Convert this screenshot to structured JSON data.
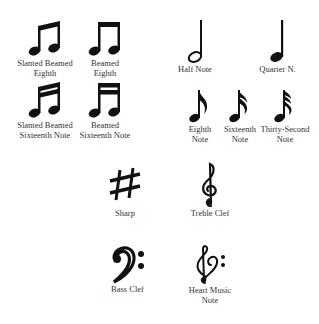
{
  "symbols": [
    {
      "id": "slanted-beamed-eighth",
      "lines": [
        "Slanted Beamed",
        "Eighth"
      ]
    },
    {
      "id": "beamed-eighth",
      "lines": [
        "Beamed",
        "Eighth"
      ]
    },
    {
      "id": "half-note",
      "lines": [
        "Half Note"
      ]
    },
    {
      "id": "quarter-note",
      "lines": [
        "Quarter N."
      ]
    },
    {
      "id": "slanted-beamed-sixteenth",
      "lines": [
        "Slanted Beamed",
        "Sixteenth Note"
      ]
    },
    {
      "id": "beamed-sixteenth",
      "lines": [
        "Beamed",
        "Sixteenth Note"
      ]
    },
    {
      "id": "eighth-note",
      "lines": [
        "Eighth",
        "Note"
      ]
    },
    {
      "id": "sixteenth-note",
      "lines": [
        "Sixteenth",
        "Note"
      ]
    },
    {
      "id": "thirty-second-note",
      "lines": [
        "Thirty-Second",
        "Note"
      ]
    },
    {
      "id": "sharp",
      "lines": [
        "Sharp"
      ]
    },
    {
      "id": "treble-clef",
      "lines": [
        "Treble Clef"
      ]
    },
    {
      "id": "bass-clef",
      "lines": [
        "Bass Clef"
      ]
    },
    {
      "id": "heart-music-note",
      "lines": [
        "Heart Music",
        "Note"
      ]
    }
  ],
  "colors": {
    "ink": "#111111",
    "text": "#333333",
    "background": "#ffffff"
  }
}
